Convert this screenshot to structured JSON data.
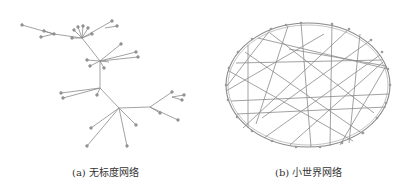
{
  "figure": {
    "panels": [
      {
        "id": "a",
        "caption": "(a) 无标度网络",
        "type": "scale-free network",
        "hubs": [
          {
            "x": 82,
            "y": 38
          },
          {
            "x": 100,
            "y": 61
          },
          {
            "x": 100,
            "y": 88
          },
          {
            "x": 119,
            "y": 108
          },
          {
            "x": 150,
            "y": 107
          }
        ]
      },
      {
        "id": "b",
        "caption": "(b) 小世界网络",
        "type": "small-world network",
        "ring": {
          "cx": 308,
          "cy": 85,
          "rx": 82,
          "ry": 62
        }
      }
    ],
    "colors": {
      "edge": "#8a8a8a",
      "node": "#9a9a9a",
      "caption": "#333333"
    }
  }
}
